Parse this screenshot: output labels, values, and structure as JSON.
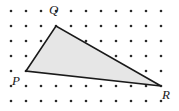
{
  "figure": {
    "background_color": "#ffffff",
    "width": 179,
    "height": 111
  },
  "grid": {
    "dot_color": "#2b2b2b",
    "dot_radius": 1.3,
    "origin_x": 11,
    "origin_y": 11,
    "spacing_x": 15,
    "spacing_y": 15,
    "columns": 11,
    "rows": 7
  },
  "shape": {
    "name": "triangle",
    "fill_color": "#e6e6e6",
    "stroke_color": "#1a1a1a",
    "stroke_width": 1.6,
    "points": "26,71 56,26 161,86",
    "vertices": [
      {
        "id": "P",
        "label": "P",
        "x": 26,
        "y": 71,
        "label_x": 12,
        "label_y": 74
      },
      {
        "id": "Q",
        "label": "Q",
        "x": 56,
        "y": 26,
        "label_x": 49,
        "label_y": 3
      },
      {
        "id": "R",
        "label": "R",
        "x": 161,
        "y": 86,
        "label_x": 162,
        "label_y": 88
      }
    ]
  }
}
